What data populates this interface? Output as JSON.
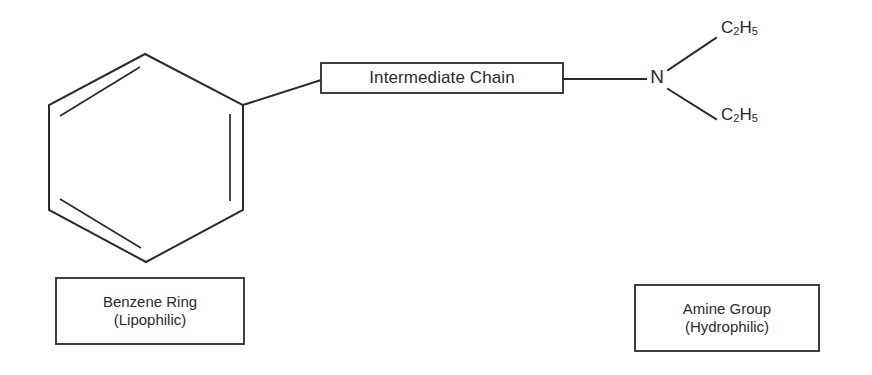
{
  "diagram": {
    "background_color": "#ffffff",
    "line_color": "#2b2b2b"
  },
  "structure": {
    "benzene_ring": {
      "name": "benzene-ring",
      "double_bond_count": 3,
      "vertex_count": 6
    },
    "chain_box": {
      "label": "Intermediate Chain"
    },
    "amine": {
      "nitrogen_label": "N",
      "substituent_top": "C2H5",
      "substituent_bottom": "C2H5",
      "substituent_top_parts": {
        "element1": "C",
        "sub1": "2",
        "element2": "H",
        "sub2": "5"
      },
      "substituent_bottom_parts": {
        "element1": "C",
        "sub1": "2",
        "element2": "H",
        "sub2": "5"
      }
    }
  },
  "captions": {
    "left": {
      "line1": "Benzene Ring",
      "line2": "(Lipophilic)"
    },
    "right": {
      "line1": "Amine Group",
      "line2": "(Hydrophilic)"
    }
  }
}
